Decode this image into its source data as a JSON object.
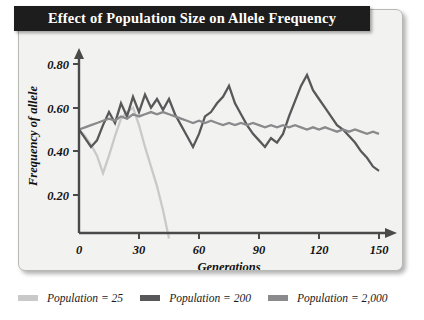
{
  "chart_data": {
    "type": "line",
    "title": "Effect of Population Size on Allele Frequency",
    "xlabel": "Generations",
    "ylabel": "Frequency of allele",
    "xlim": [
      0,
      150
    ],
    "ylim": [
      0,
      0.8
    ],
    "xticks": [
      0,
      30,
      60,
      90,
      120,
      150
    ],
    "xtick_labels": [
      "0",
      "30",
      "60",
      "90",
      "120",
      "150"
    ],
    "yticks": [
      0.2,
      0.4,
      0.6,
      0.8
    ],
    "ytick_labels": [
      "0.20",
      "0.40",
      "0.60",
      "0.80"
    ],
    "origin_label": "0",
    "grid": false,
    "legend_position": "below",
    "series": [
      {
        "name": "Population = 25",
        "color": "#c9c9c9",
        "x": [
          0,
          3,
          6,
          9,
          12,
          15,
          18,
          21,
          24,
          27,
          30,
          33,
          36,
          39,
          42,
          45
        ],
        "values": [
          0.5,
          0.47,
          0.43,
          0.38,
          0.3,
          0.38,
          0.47,
          0.55,
          0.58,
          0.6,
          0.52,
          0.42,
          0.33,
          0.24,
          0.13,
          0.0
        ]
      },
      {
        "name": "Population = 200",
        "color": "#58585a",
        "x": [
          0,
          3,
          6,
          9,
          12,
          15,
          18,
          21,
          24,
          27,
          30,
          33,
          36,
          39,
          42,
          45,
          48,
          51,
          54,
          57,
          60,
          63,
          66,
          69,
          72,
          75,
          78,
          81,
          84,
          87,
          90,
          93,
          96,
          99,
          102,
          105,
          108,
          111,
          114,
          117,
          120,
          123,
          126,
          129,
          132,
          135,
          138,
          141,
          144,
          147,
          150
        ],
        "values": [
          0.5,
          0.46,
          0.42,
          0.45,
          0.52,
          0.58,
          0.53,
          0.62,
          0.56,
          0.65,
          0.58,
          0.66,
          0.6,
          0.64,
          0.59,
          0.64,
          0.57,
          0.52,
          0.47,
          0.42,
          0.48,
          0.56,
          0.58,
          0.62,
          0.65,
          0.7,
          0.62,
          0.57,
          0.52,
          0.48,
          0.45,
          0.42,
          0.46,
          0.44,
          0.48,
          0.56,
          0.63,
          0.7,
          0.75,
          0.68,
          0.64,
          0.6,
          0.56,
          0.52,
          0.5,
          0.47,
          0.44,
          0.4,
          0.37,
          0.33,
          0.31
        ]
      },
      {
        "name": "Population = 2,000",
        "color": "#8a8a8c",
        "x": [
          0,
          3,
          6,
          9,
          12,
          15,
          18,
          21,
          24,
          27,
          30,
          33,
          36,
          39,
          42,
          45,
          48,
          51,
          54,
          57,
          60,
          63,
          66,
          69,
          72,
          75,
          78,
          81,
          84,
          87,
          90,
          93,
          96,
          99,
          102,
          105,
          108,
          111,
          114,
          117,
          120,
          123,
          126,
          129,
          132,
          135,
          138,
          141,
          144,
          147,
          150
        ],
        "values": [
          0.5,
          0.51,
          0.52,
          0.53,
          0.54,
          0.55,
          0.54,
          0.56,
          0.55,
          0.57,
          0.56,
          0.57,
          0.58,
          0.57,
          0.58,
          0.57,
          0.56,
          0.55,
          0.54,
          0.53,
          0.54,
          0.53,
          0.54,
          0.53,
          0.52,
          0.53,
          0.52,
          0.53,
          0.52,
          0.53,
          0.52,
          0.51,
          0.52,
          0.51,
          0.52,
          0.51,
          0.52,
          0.51,
          0.5,
          0.51,
          0.5,
          0.51,
          0.5,
          0.49,
          0.5,
          0.49,
          0.5,
          0.49,
          0.48,
          0.49,
          0.48
        ]
      }
    ]
  },
  "legend": {
    "entries": [
      {
        "label": "Population = 25",
        "color": "#c9c9c9"
      },
      {
        "label": "Population = 200",
        "color": "#58585a"
      },
      {
        "label": "Population = 2,000",
        "color": "#8a8a8c"
      }
    ]
  },
  "colors": {
    "title_bar_bg": "#1d1d1d",
    "title_text": "#ffffff",
    "panel_bg": "#f2f2f0",
    "axis": "#4a4a4a"
  }
}
